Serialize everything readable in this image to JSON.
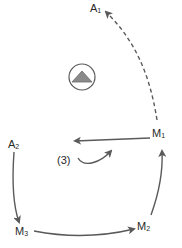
{
  "diagram": {
    "nodes": [
      {
        "id": "A1",
        "base": "A",
        "sub": "1"
      },
      {
        "id": "M1",
        "base": "M",
        "sub": "1"
      },
      {
        "id": "A2",
        "base": "A",
        "sub": "2"
      },
      {
        "id": "M2",
        "base": "M",
        "sub": "2"
      },
      {
        "id": "M3",
        "base": "M",
        "sub": "3"
      }
    ],
    "annotation": "(3)",
    "symbol": "triangle-in-circle-icon",
    "edges": [
      {
        "from": "M1",
        "to": "A1",
        "style": "dashed"
      },
      {
        "from": "M1",
        "to": "left",
        "style": "solid"
      },
      {
        "from": "(3)",
        "to": "M1",
        "style": "solid-curved"
      },
      {
        "from": "A2",
        "to": "M3",
        "style": "solid"
      },
      {
        "from": "M3",
        "to": "M2",
        "style": "solid"
      },
      {
        "from": "M2",
        "to": "M1",
        "style": "solid"
      }
    ],
    "colors": {
      "line": "#5a5a5a",
      "triangle_fill": "#8a8a8a",
      "text": "#2a2a2a"
    }
  }
}
